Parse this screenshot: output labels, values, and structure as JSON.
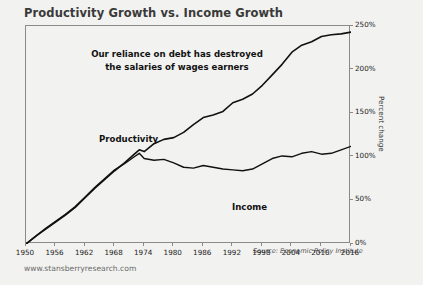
{
  "chart_data": {
    "type": "line",
    "title": "Productivity Growth vs. Income Growth",
    "xlabel": "",
    "ylabel": "Percent change",
    "xlim": [
      1950,
      2016
    ],
    "ylim": [
      0,
      250
    ],
    "grid": false,
    "legend_position": "inline-labels",
    "x_ticks": [
      "1950",
      "1956",
      "1962",
      "1968",
      "1974",
      "1980",
      "1986",
      "1992",
      "1998",
      "2004",
      "2010",
      "2016"
    ],
    "y_ticks": [
      "0%",
      "50%",
      "100%",
      "150%",
      "200%",
      "250%"
    ],
    "annotation": "Our reliance on debt has destroyed the salaries of wages earners",
    "annotation_line1": "Our reliance on debt has destroyed",
    "annotation_line2": "the salaries of wages earners",
    "source": "Source: Economic Policy Institute",
    "x": [
      1950,
      1952,
      1954,
      1956,
      1958,
      1960,
      1962,
      1964,
      1966,
      1968,
      1970,
      1972,
      1973,
      1974,
      1976,
      1978,
      1980,
      1982,
      1984,
      1986,
      1988,
      1990,
      1992,
      1994,
      1996,
      1998,
      2000,
      2002,
      2004,
      2006,
      2008,
      2010,
      2012,
      2014,
      2016
    ],
    "series": [
      {
        "name": "Productivity",
        "color": "#111111",
        "label_text": "Productivity",
        "values": [
          0,
          9,
          17,
          25,
          33,
          42,
          53,
          64,
          74,
          84,
          93,
          103,
          108,
          106,
          115,
          120,
          122,
          128,
          137,
          145,
          148,
          152,
          162,
          166,
          172,
          182,
          194,
          206,
          220,
          228,
          232,
          238,
          240,
          241,
          243
        ]
      },
      {
        "name": "Income",
        "color": "#111111",
        "label_text": "Income",
        "values": [
          0,
          9,
          18,
          26,
          34,
          43,
          54,
          65,
          75,
          85,
          92,
          100,
          104,
          98,
          96,
          97,
          93,
          88,
          87,
          90,
          88,
          86,
          85,
          84,
          86,
          92,
          98,
          101,
          100,
          104,
          106,
          103,
          104,
          108,
          112
        ]
      }
    ]
  },
  "footer": {
    "url": "www.stansberryresearch.com"
  }
}
